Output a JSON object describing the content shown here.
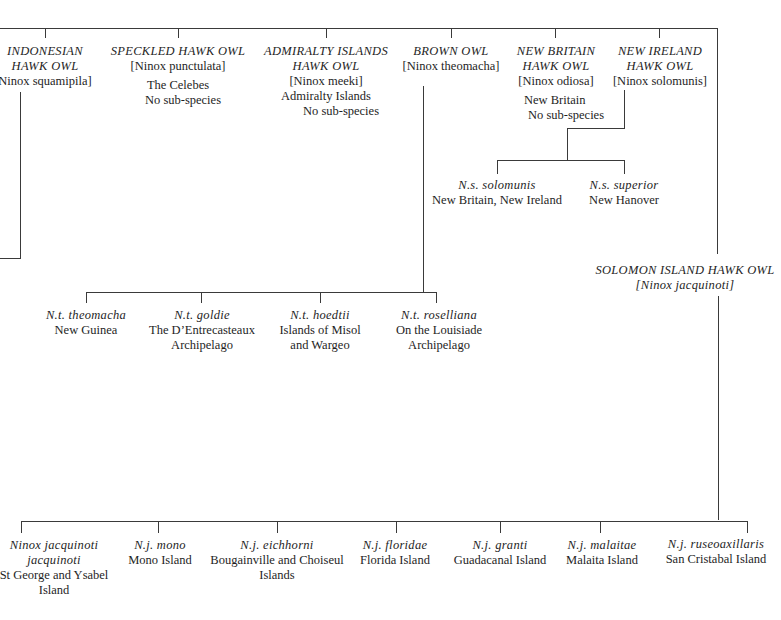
{
  "diagram": {
    "species": [
      {
        "common": [
          "INDONESIAN",
          "HAWK OWL"
        ],
        "latin": "Ninox squamipila]",
        "range": [],
        "note": ""
      },
      {
        "common": [
          "SPECKLED HAWK OWL"
        ],
        "latin": "[Ninox punctulata]",
        "range": [
          "The Celebes"
        ],
        "note": "No sub-species"
      },
      {
        "common": [
          "ADMIRALTY ISLANDS",
          "HAWK OWL"
        ],
        "latin": "[Ninox meeki]",
        "range": [
          "Admiralty Islands"
        ],
        "note": "No sub-species"
      },
      {
        "common": [
          "BROWN OWL"
        ],
        "latin": "[Ninox theomacha]",
        "range": [],
        "note": ""
      },
      {
        "common": [
          "NEW BRITAIN",
          "HAWK OWL"
        ],
        "latin": "[Ninox odiosa]",
        "range": [
          "New Britain"
        ],
        "note": "No sub-species"
      },
      {
        "common": [
          "NEW IRELAND",
          "HAWK OWL"
        ],
        "latin": "[Ninox solomunis]",
        "range": [],
        "note": ""
      }
    ],
    "solomunis_subspecies": [
      {
        "name": "N.s. solomunis",
        "range": [
          "New Britain, New Ireland"
        ]
      },
      {
        "name": "N.s. superior",
        "range": [
          "New Hanover"
        ]
      }
    ],
    "theomacha_subspecies": [
      {
        "name": "N.t. theomacha",
        "range": [
          "New Guinea"
        ]
      },
      {
        "name": "N.t. goldie",
        "range": [
          "The D’Entrecasteaux",
          "Archipelago"
        ]
      },
      {
        "name": "N.t. hoedtii",
        "range": [
          "Islands of Misol",
          "and Wargeo"
        ]
      },
      {
        "name": "N.t. roselliana",
        "range": [
          "On the Louisiade",
          "Archipelago"
        ]
      }
    ],
    "solomon": {
      "common": "SOLOMON ISLAND HAWK OWL",
      "latin": "[Ninox jacquinoti]"
    },
    "jacquinoti_subspecies": [
      {
        "name": [
          "Ninox jacquinoti",
          "jacquinoti"
        ],
        "range": [
          "St George and Ysabel",
          "Island"
        ]
      },
      {
        "name": [
          "N.j. mono"
        ],
        "range": [
          "Mono Island"
        ]
      },
      {
        "name": [
          "N.j. eichhorni"
        ],
        "range": [
          "Bougainville and Choiseul",
          "Islands"
        ]
      },
      {
        "name": [
          "N.j. floridae"
        ],
        "range": [
          "Florida Island"
        ]
      },
      {
        "name": [
          "N.j. granti"
        ],
        "range": [
          "Guadacanal Island"
        ]
      },
      {
        "name": [
          "N.j. malaitae"
        ],
        "range": [
          "Malaita Island"
        ]
      },
      {
        "name": [
          "N.j. ruseoaxillaris"
        ],
        "range": [
          "San Cristabal Island"
        ]
      }
    ]
  }
}
